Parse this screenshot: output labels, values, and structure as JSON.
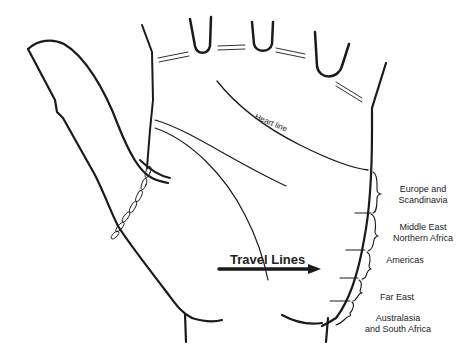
{
  "diagram": {
    "labels": {
      "heart_line": "Heart line",
      "travel_lines": "Travel Lines"
    },
    "regions": [
      {
        "label_line1": "Europe and",
        "label_line2": "Scandinavia"
      },
      {
        "label_line1": "Middle East",
        "label_line2": "Northern Africa"
      },
      {
        "label_line1": "Americas",
        "label_line2": ""
      },
      {
        "label_line1": "Far East",
        "label_line2": ""
      },
      {
        "label_line1": "Australasia",
        "label_line2": "and South Africa"
      }
    ],
    "colors": {
      "line": "#1a1a1a",
      "background": "#ffffff"
    }
  }
}
